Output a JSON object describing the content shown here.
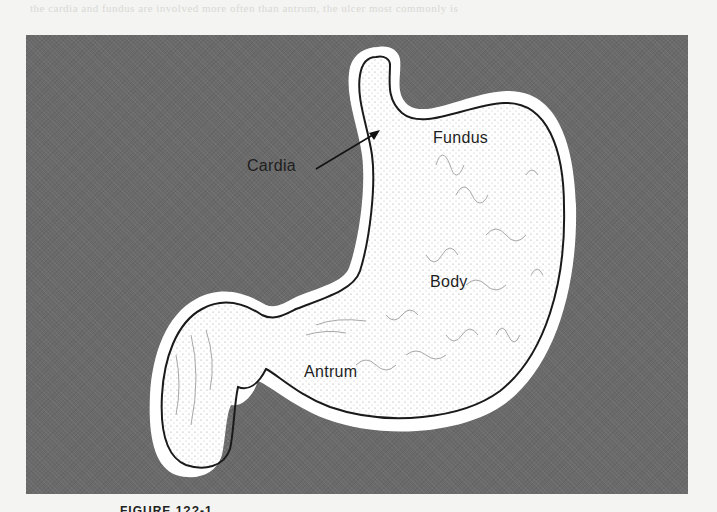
{
  "figure": {
    "caption_partial": "FIGURE 1??-1",
    "background_color": "#6a6a6a",
    "outline_color": "#1a1a1a",
    "lining_color": "#ffffff"
  },
  "labels": {
    "fundus": "Fundus",
    "cardia": "Cardia",
    "body": "Body",
    "antrum": "Antrum"
  },
  "annotations": {
    "cardia_arrow": "arrow from Cardia label to cardia region"
  },
  "bleed_through_text": "the cardia and fundus are involved more often than antrum, the ulcer most commonly is"
}
